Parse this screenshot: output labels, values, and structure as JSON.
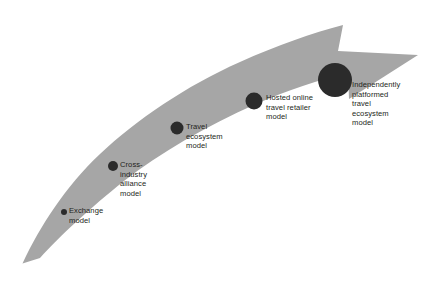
{
  "diagram": {
    "type": "curved-arrow-progression",
    "title_visible": false,
    "background_color": "#ffffff",
    "arrow": {
      "name": "growth-arrow",
      "fill_color": "#a6a6a6",
      "direction": "lower-left to upper-right",
      "has_arrowhead": true,
      "tail_point": "sharp taper at bottom-left",
      "tip_point": "sharp point at right"
    },
    "marker_color": "#2b2b2b",
    "text_color": "#231f20",
    "stages": [
      {
        "index": 1,
        "label": "Exchange\nmodel",
        "label_lines": [
          "Exchange",
          "model"
        ],
        "marker_name": "stage-marker-exchange-model",
        "marker_diameter_px": 6,
        "marker_cx": 64,
        "marker_cy": 212
      },
      {
        "index": 2,
        "label": "Cross-\nindustry\nalliance\nmodel",
        "label_lines": [
          "Cross-",
          "industry",
          "alliance",
          "model"
        ],
        "marker_name": "stage-marker-cross-industry-alliance-model",
        "marker_diameter_px": 10,
        "marker_cx": 113,
        "marker_cy": 166
      },
      {
        "index": 3,
        "label": "Travel\necosystem\nmodel",
        "label_lines": [
          "Travel",
          "ecosystem",
          "model"
        ],
        "marker_name": "stage-marker-travel-ecosystem-model",
        "marker_diameter_px": 13,
        "marker_cx": 177,
        "marker_cy": 128
      },
      {
        "index": 4,
        "label": "Hosted online\ntravel retailer\nmodel",
        "label_lines": [
          "Hosted online",
          "travel retailer",
          "model"
        ],
        "marker_name": "stage-marker-hosted-online-travel-retailer-model",
        "marker_diameter_px": 17,
        "marker_cx": 254,
        "marker_cy": 101
      },
      {
        "index": 5,
        "label": "Independently\nplatformed\ntravel\necosystem\nmodel",
        "label_lines": [
          "Independently",
          "platformed",
          "travel",
          "ecosystem",
          "model"
        ],
        "marker_name": "stage-marker-independently-platformed-travel-ecosystem-model",
        "marker_diameter_px": 34,
        "marker_cx": 335,
        "marker_cy": 80
      }
    ]
  }
}
